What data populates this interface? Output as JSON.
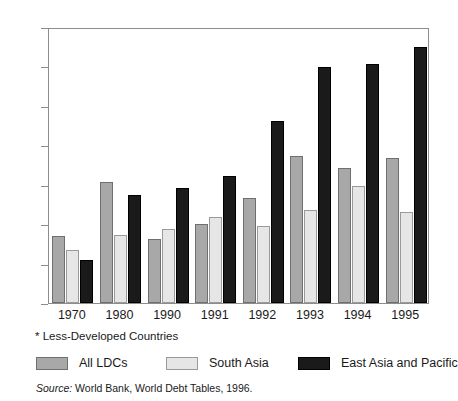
{
  "chart_data": {
    "type": "bar",
    "title": "",
    "subtitle": "",
    "xlabel": "",
    "ylabel": "",
    "categories": [
      "1970",
      "1980",
      "1990",
      "1991",
      "1992",
      "1993",
      "1994",
      "1995"
    ],
    "series": [
      {
        "name": "All LDCs",
        "color": "#a8a8a8",
        "values": [
          1.7,
          3.07,
          1.62,
          2.0,
          2.67,
          3.73,
          3.43,
          3.68
        ]
      },
      {
        "name": "South Asia",
        "color": "#e6e6e6",
        "values": [
          1.35,
          1.72,
          1.88,
          2.17,
          1.96,
          2.36,
          2.97,
          2.31
        ]
      },
      {
        "name": "East Asia and Pacific",
        "color": "#1a1a1a",
        "values": [
          1.08,
          2.73,
          2.92,
          3.22,
          4.62,
          5.99,
          6.07,
          6.5
        ]
      }
    ],
    "ylim": [
      0,
      7
    ],
    "ytick_values": [
      0,
      1,
      2,
      3,
      4,
      5,
      6,
      7
    ],
    "ytick_labels": [
      "0",
      "1",
      "2",
      "3",
      "4",
      "5",
      "6",
      "7"
    ],
    "grid": false,
    "legend_position": "bottom"
  },
  "footnote": {
    "text": "* Less-Developed Countries"
  },
  "legend": {
    "items": [
      {
        "label": "All LDCs",
        "swatch": "legend-swatch-all-ldcs"
      },
      {
        "label": "South Asia",
        "swatch": "legend-swatch-south-asia"
      },
      {
        "label": "East Asia and Pacific",
        "swatch": "legend-swatch-east-asia-pacific"
      }
    ]
  },
  "source": {
    "prefix": "Source:",
    "text": " World Bank, World Debt Tables, 1996."
  },
  "colors": {
    "series_all_ldcs": "#a8a8a8",
    "series_south_asia": "#e6e6e6",
    "series_east_asia_pacific": "#1a1a1a",
    "axis": "#8d8d8d",
    "text": "#1a1a1a",
    "background": "#ffffff"
  }
}
